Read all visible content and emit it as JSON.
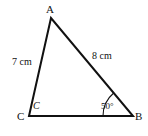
{
  "figure": {
    "type": "geometry-diagram",
    "shape": "triangle",
    "background_color": "#ffffff",
    "stroke_color": "#111111",
    "stroke_width": 2,
    "width": 148,
    "height": 136,
    "vertices": {
      "A": {
        "label": "A",
        "x": 51,
        "y": 18
      },
      "B": {
        "label": "B",
        "x": 133,
        "y": 116
      },
      "C": {
        "label": "C",
        "x": 29,
        "y": 116
      }
    },
    "interior_vertex_label": {
      "text": "C",
      "x": 36,
      "y": 107
    },
    "sides": [
      {
        "name": "CA",
        "label": "7 cm",
        "from": "C",
        "to": "A",
        "label_x": 22,
        "label_y": 62
      },
      {
        "name": "AB",
        "label": "8 cm",
        "from": "A",
        "to": "B",
        "label_x": 104,
        "label_y": 56
      },
      {
        "name": "CB",
        "label": "",
        "from": "C",
        "to": "B"
      }
    ],
    "angles": [
      {
        "at": "B",
        "label": "50°",
        "arc_radius": 30,
        "label_x": 110,
        "label_y": 107
      }
    ]
  },
  "chart_data": {
    "type": "diagram",
    "title": "",
    "labels": [
      "A",
      "B",
      "C",
      "C",
      "7 cm",
      "8 cm",
      "50°"
    ]
  }
}
